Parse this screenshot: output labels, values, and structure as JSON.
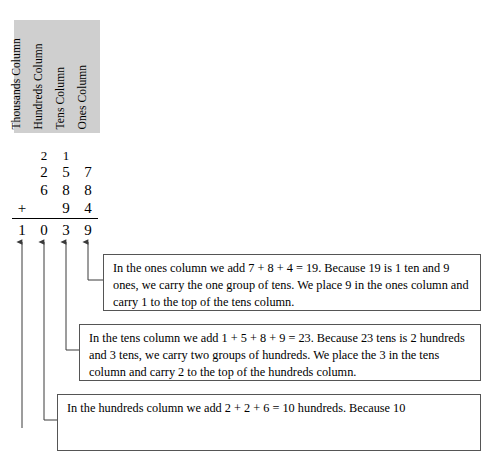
{
  "columns": {
    "labels": [
      {
        "key": "thousands",
        "text": "Thousands Column"
      },
      {
        "key": "hundreds",
        "text": "Hundreds Column"
      },
      {
        "key": "tens",
        "text": "Tens Column"
      },
      {
        "key": "ones",
        "text": "Ones Column"
      }
    ]
  },
  "arithmetic": {
    "carry_row": {
      "thousands": "",
      "hundreds": "2",
      "tens": "1",
      "ones": ""
    },
    "addend_1": {
      "thousands": "",
      "hundreds": "2",
      "tens": "5",
      "ones": "7"
    },
    "addend_2": {
      "thousands": "",
      "hundreds": "6",
      "tens": "8",
      "ones": "8"
    },
    "addend_3": {
      "thousands": "",
      "hundreds": "",
      "tens": "9",
      "ones": "4"
    },
    "operator": "+",
    "sum_row": {
      "thousands": "1",
      "hundreds": "0",
      "tens": "3",
      "ones": "9"
    }
  },
  "explanations": {
    "ones": "In the ones column we add 7 + 8 + 4 = 19. Because 19 is 1 ten and 9 ones, we carry the one group of tens. We place 9 in the ones column and carry 1 to the top of the tens column.",
    "tens": "In the tens column we add 1 + 5 + 8 + 9 = 23. Because 23 tens is 2 hundreds and 3 tens, we carry two groups of hundreds. We place the 3 in the tens column and carry 2 to the top of the hundreds column.",
    "hundreds": "In the hundreds column we add 2 + 2 + 6 = 10 hundreds. Because 10"
  },
  "colors": {
    "header_background": "#cfcfcf",
    "line": "#555555",
    "text": "#000000"
  }
}
